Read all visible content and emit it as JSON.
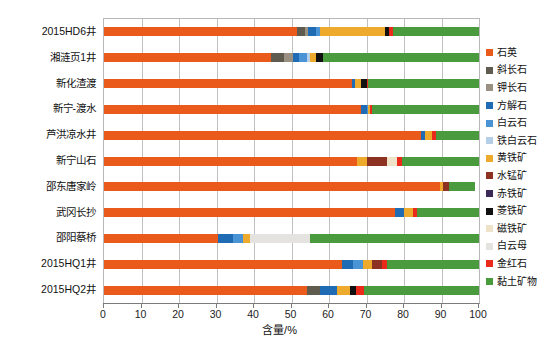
{
  "chart_data": {
    "type": "bar",
    "orientation": "horizontal",
    "stacked": true,
    "title": "",
    "xlabel": "含量/%",
    "ylabel": "",
    "xlim": [
      0,
      100
    ],
    "xticks": [
      0,
      10,
      20,
      30,
      40,
      50,
      60,
      70,
      80,
      90,
      100
    ],
    "grid": true,
    "legend_position": "right",
    "categories": [
      "2015HD6井",
      "湘涟页1井",
      "新化渣渡",
      "新宁-渡水",
      "芦洪凉水井",
      "新宁山石",
      "邵东唐家岭",
      "武冈长抄",
      "邵阳蔡桥",
      "2015HQ1井",
      "2015HQ2井"
    ],
    "series": [
      {
        "name": "石英",
        "color": "#ea5b1b",
        "values": [
          51.5,
          44.5,
          66.0,
          68.5,
          84.5,
          67.5,
          89.5,
          77.5,
          30.5,
          63.5,
          54.0
        ]
      },
      {
        "name": "斜长石",
        "color": "#5f5b4e",
        "values": [
          2.0,
          3.5,
          0.0,
          0.0,
          0.0,
          0.0,
          0.0,
          0.0,
          0.0,
          0.0,
          3.5
        ]
      },
      {
        "name": "钾长石",
        "color": "#9b9183",
        "values": [
          0.8,
          2.5,
          0.0,
          0.0,
          0.0,
          0.0,
          0.0,
          0.0,
          0.0,
          0.0,
          0.0
        ]
      },
      {
        "name": "方解石",
        "color": "#1f6cb5",
        "values": [
          2.2,
          1.5,
          1.0,
          1.5,
          1.2,
          0.0,
          0.0,
          2.5,
          4.0,
          3.0,
          4.5
        ]
      },
      {
        "name": "白云石",
        "color": "#4a94d6",
        "values": [
          1.0,
          2.0,
          0.0,
          0.5,
          0.0,
          0.0,
          0.0,
          0.0,
          2.5,
          2.5,
          0.0
        ]
      },
      {
        "name": "铁白云石",
        "color": "#b5cfe8",
        "values": [
          0.0,
          1.0,
          0.0,
          0.0,
          0.0,
          0.0,
          0.0,
          0.0,
          0.0,
          0.0,
          0.0
        ]
      },
      {
        "name": "黄铁矿",
        "color": "#eeaa2c",
        "values": [
          17.5,
          1.5,
          1.5,
          0.5,
          1.8,
          2.5,
          1.0,
          2.5,
          2.0,
          2.5,
          3.5
        ]
      },
      {
        "name": "水锰矿",
        "color": "#8d3123",
        "values": [
          0.0,
          0.0,
          0.0,
          0.0,
          0.0,
          5.5,
          1.5,
          0.0,
          0.0,
          2.5,
          0.0
        ]
      },
      {
        "name": "赤铁矿",
        "color": "#3b2a55",
        "values": [
          0.0,
          0.0,
          0.0,
          0.0,
          0.0,
          0.0,
          0.0,
          0.0,
          0.0,
          0.0,
          0.0
        ]
      },
      {
        "name": "菱铁矿",
        "color": "#111111",
        "values": [
          1.0,
          2.0,
          1.5,
          0.0,
          0.0,
          0.0,
          0.0,
          0.0,
          0.0,
          0.0,
          1.8
        ]
      },
      {
        "name": "磁铁矿",
        "color": "#eee2c8",
        "values": [
          0.0,
          0.0,
          0.0,
          0.0,
          0.0,
          2.5,
          0.0,
          0.0,
          0.0,
          0.0,
          0.0
        ]
      },
      {
        "name": "白云母",
        "color": "#e4e3df",
        "values": [
          0.0,
          0.0,
          0.0,
          0.0,
          0.0,
          0.0,
          0.0,
          0.0,
          16.0,
          0.0,
          0.0
        ]
      },
      {
        "name": "金红石",
        "color": "#ea2a1a",
        "values": [
          1.0,
          0.0,
          0.5,
          0.5,
          1.0,
          1.5,
          0.0,
          1.0,
          0.0,
          1.5,
          2.0
        ]
      },
      {
        "name": "黏土矿物",
        "color": "#4a9b3e",
        "values": [
          23.0,
          41.5,
          29.5,
          28.5,
          11.5,
          20.5,
          7.0,
          16.5,
          45.0,
          24.5,
          30.7
        ]
      }
    ]
  },
  "legend": {
    "items": [
      {
        "label": "石英"
      },
      {
        "label": "斜长石"
      },
      {
        "label": "钾长石"
      },
      {
        "label": "方解石"
      },
      {
        "label": "白云石"
      },
      {
        "label": "铁白云石"
      },
      {
        "label": "黄铁矿"
      },
      {
        "label": "水锰矿"
      },
      {
        "label": "赤铁矿"
      },
      {
        "label": "菱铁矿"
      },
      {
        "label": "磁铁矿"
      },
      {
        "label": "白云母"
      },
      {
        "label": "金红石"
      },
      {
        "label": "黏土矿物"
      }
    ]
  }
}
